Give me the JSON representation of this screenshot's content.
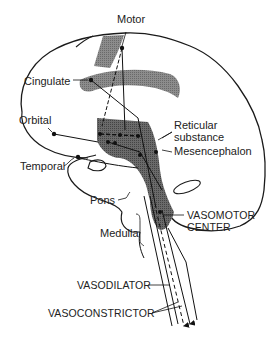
{
  "figure": {
    "colors": {
      "outline": "#1a1a1a",
      "shading_dark": "#5a5a5a",
      "shading_light": "#9a9a9a",
      "background": "#ffffff"
    },
    "labels": {
      "motor": "Motor",
      "cingulate": "Cingulate",
      "orbital": "Orbital",
      "temporal": "Temporal",
      "reticular_1": "Reticular",
      "reticular_2": "substance",
      "mesencephalon": "Mesencephalon",
      "pons": "Pons",
      "medulla": "Medulla",
      "vasomotor_1": "VASOMOTOR",
      "vasomotor_2": "CENTER",
      "vasodilator": "VASODILATOR",
      "vasoconstrictor": "VASOCONSTRICTOR"
    }
  }
}
